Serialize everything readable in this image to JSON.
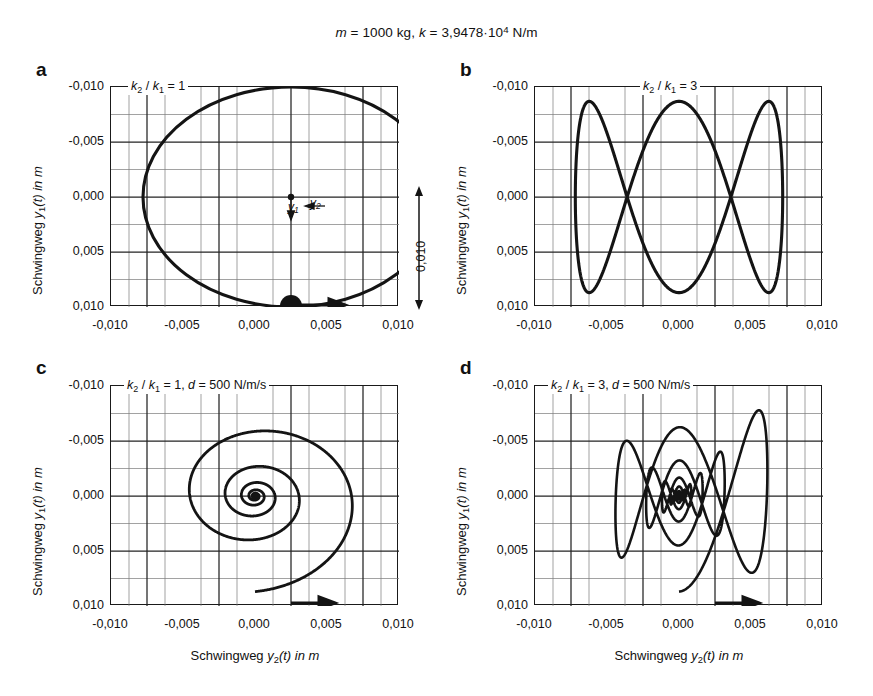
{
  "figure": {
    "title_parts": {
      "m_sym": "m",
      "m_eq": " = 1000 kg,  ",
      "k_sym": "k",
      "k_eq": " = 3,9478",
      "dot": "·",
      "base": "10",
      "exp": "4",
      "unit": " N/m"
    },
    "title_plain": "m = 1000 kg, k = 3,9478·10^4 N/m",
    "axis_titles": {
      "y": "Schwingweg y1(t) in m",
      "x": "Schwingweg y2(t) in m",
      "y_prefix": "Schwingweg ",
      "y_var": "y",
      "y_sub": "1",
      "y_suffix": "(t) in m",
      "x_prefix": "Schwingweg ",
      "x_var": "y",
      "x_sub": "2",
      "x_suffix": "(t) in m"
    },
    "ticks": {
      "y": [
        "-0,010",
        "-0,005",
        "0,000",
        "0,005",
        "0,010"
      ],
      "x": [
        "-0,010",
        "-0,005",
        "0,000",
        "0,005",
        "0,010"
      ]
    },
    "amplitude_annotation": "0,010",
    "point_labels": {
      "y1": "y",
      "y1_sub": "1",
      "y2": "y",
      "y2_sub": "2"
    },
    "colors": {
      "curve": "#1a1a1a",
      "grid_major": "#2b2b2b",
      "grid_minor": "#6e6e6e",
      "axis": "#1a1a1a",
      "background": "#ffffff"
    }
  },
  "panels": [
    {
      "id": "a",
      "letter": "a",
      "note_plain": "k2 / k1 = 1",
      "note": {
        "k": "k",
        "sub1": "2",
        "slash": " / ",
        "k2": "k",
        "sub2": "1",
        "eq": " = 1"
      },
      "has_damping": false,
      "marker": true,
      "arrow": true
    },
    {
      "id": "b",
      "letter": "b",
      "note_plain": "k2 / k1 = 3",
      "note": {
        "k": "k",
        "sub1": "2",
        "slash": " / ",
        "k2": "k",
        "sub2": "1",
        "eq": " = 3"
      },
      "has_damping": false,
      "marker": false,
      "arrow": false
    },
    {
      "id": "c",
      "letter": "c",
      "note_plain": "k2 / k1 = 1, d = 500 N/m/s",
      "note": {
        "k": "k",
        "sub1": "2",
        "slash": " / ",
        "k2": "k",
        "sub2": "1",
        "eq": " = 1,  ",
        "d": "d",
        "deq": " = 500 N/m/s"
      },
      "has_damping": true,
      "marker": false,
      "arrow": true
    },
    {
      "id": "d",
      "letter": "d",
      "note_plain": "k2 / k1 = 3, d = 500 N/m/s",
      "note": {
        "k": "k",
        "sub1": "2",
        "slash": " / ",
        "k2": "k",
        "sub2": "1",
        "eq": " = 3,  ",
        "d": "d",
        "deq": " = 500 N/m/s"
      },
      "has_damping": true,
      "marker": false,
      "arrow": true
    }
  ],
  "chart_data": [
    {
      "id": "a",
      "type": "line",
      "title": "k2/k1 = 1",
      "xlabel": "Schwingweg y2(t) in m",
      "ylabel": "Schwingweg y1(t) in m",
      "xlim": [
        -0.0125,
        0.0125
      ],
      "ylim": [
        0.0115,
        -0.0115
      ],
      "y_axis_inverted": true,
      "xticks": [
        -0.01,
        -0.005,
        0.0,
        0.005,
        0.01
      ],
      "yticks": [
        -0.01,
        -0.005,
        0.0,
        0.005,
        0.01
      ],
      "grid": "major+minor",
      "curve": "closed ellipse (Lissajous 1:1), semi-axis x = 0.0103 m, semi-axis y = 0.0100 m, centred at origin",
      "params": {
        "freq_ratio_x": 1,
        "freq_ratio_y": 1,
        "amp_x": 0.0103,
        "amp_y": 0.01,
        "phase_deg": 90,
        "damping": 0
      },
      "annotations": [
        {
          "kind": "start-marker",
          "x": 0.0,
          "y": 0.01
        },
        {
          "kind": "direction-arrow",
          "x": 0.0035,
          "y": 0.0099,
          "label": ""
        },
        {
          "kind": "origin-dot",
          "x": 0.0,
          "y": 0.0
        },
        {
          "kind": "axis-arrow",
          "label": "y1",
          "direction": "down"
        },
        {
          "kind": "axis-arrow",
          "label": "y2",
          "direction": "left"
        },
        {
          "kind": "amplitude-bar",
          "label": "0,010",
          "span": 0.01
        }
      ]
    },
    {
      "id": "b",
      "type": "line",
      "title": "k2/k1 = 3",
      "xlabel": "Schwingweg y2(t) in m",
      "ylabel": "Schwingweg y1(t) in m",
      "xlim": [
        -0.0125,
        0.0125
      ],
      "ylim": [
        0.0115,
        -0.0115
      ],
      "y_axis_inverted": true,
      "xticks": [
        -0.01,
        -0.005,
        0.0,
        0.005,
        0.01
      ],
      "yticks": [
        -0.01,
        -0.005,
        0.0,
        0.005,
        0.01
      ],
      "grid": "major+minor",
      "curve": "Lissajous figure, frequency ratio 3:1, amplitude x = 0.0090 m, amplitude y = 0.0100 m, two nodes at x = -0.005 and x = +0.005",
      "params": {
        "freq_ratio_x": 1,
        "freq_ratio_y": 3,
        "amp_x": 0.009,
        "amp_y": 0.01,
        "phase_deg": 90,
        "damping": 0
      },
      "annotations": []
    },
    {
      "id": "c",
      "type": "line",
      "title": "k2/k1 = 1, d = 500 N/m/s",
      "xlabel": "Schwingweg y2(t) in m",
      "ylabel": "Schwingweg y1(t) in m",
      "xlim": [
        -0.0125,
        0.0125
      ],
      "ylim": [
        0.0115,
        -0.0115
      ],
      "y_axis_inverted": true,
      "xticks": [
        -0.01,
        -0.005,
        0.0,
        0.005,
        0.01
      ],
      "yticks": [
        -0.01,
        -0.005,
        0.0,
        0.005,
        0.01
      ],
      "grid": "major+minor",
      "curve": "inward logarithmic spiral (damped 1:1), starts at (0.000, 0.010) and decays to origin over roughly 12 revolutions",
      "params": {
        "freq_ratio_x": 1,
        "freq_ratio_y": 1,
        "amp_x": 0.01,
        "amp_y": 0.01,
        "phase_deg": 90,
        "damping": 500,
        "damping_unit": "N/m/s"
      },
      "annotations": [
        {
          "kind": "direction-arrow",
          "x": 0.0015,
          "y": 0.01,
          "label": ""
        }
      ]
    },
    {
      "id": "d",
      "type": "line",
      "title": "k2/k1 = 3, d = 500 N/m/s",
      "xlabel": "Schwingweg y2(t) in m",
      "ylabel": "Schwingweg y1(t) in m",
      "xlim": [
        -0.0125,
        0.0125
      ],
      "ylim": [
        0.0115,
        -0.0115
      ],
      "y_axis_inverted": true,
      "xticks": [
        -0.01,
        -0.005,
        0.0,
        0.005,
        0.01
      ],
      "yticks": [
        -0.01,
        -0.005,
        0.0,
        0.005,
        0.01
      ],
      "grid": "major+minor",
      "curve": "damped Lissajous 3:1, decaying envelope from amplitude x = 0.0090 m / y = 0.0100 m down to the origin",
      "params": {
        "freq_ratio_x": 1,
        "freq_ratio_y": 3,
        "amp_x": 0.009,
        "amp_y": 0.01,
        "phase_deg": 90,
        "damping": 500,
        "damping_unit": "N/m/s"
      },
      "annotations": [
        {
          "kind": "direction-arrow",
          "x": 0.0018,
          "y": 0.01,
          "label": ""
        }
      ]
    }
  ]
}
